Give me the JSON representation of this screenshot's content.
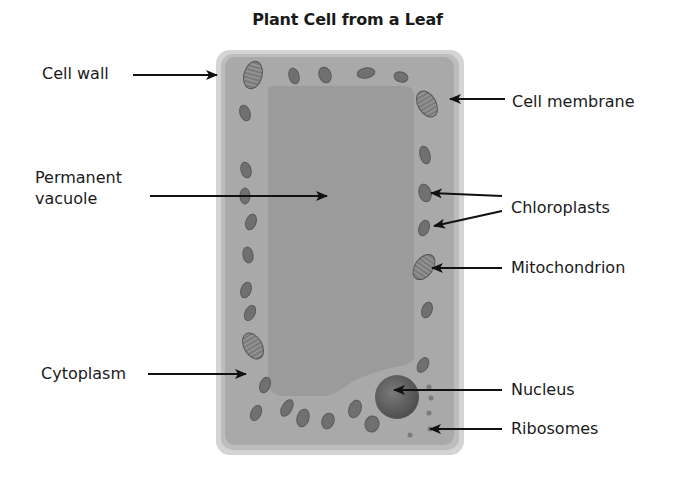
{
  "title": "Plant Cell from a Leaf",
  "labels": {
    "cell_wall": "Cell wall",
    "permanent_vacuole_line1": "Permanent",
    "permanent_vacuole_line2": "vacuole",
    "cytoplasm": "Cytoplasm",
    "cell_membrane": "Cell membrane",
    "chloroplasts": "Chloroplasts",
    "mitochondrion": "Mitochondrion",
    "nucleus": "Nucleus",
    "ribosomes": "Ribosomes"
  },
  "colors": {
    "cell_wall": "#c9c9c9",
    "cytoplasm": "#a8a8a8",
    "vacuole": "#9c9c9c",
    "organelle": "#6f6f6f",
    "nucleus": "#5e5e5e",
    "arrow": "#111111"
  }
}
